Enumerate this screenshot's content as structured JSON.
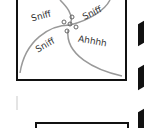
{
  "comic": {
    "panel_top": {
      "words": [
        {
          "text": "Sniff",
          "x": 31,
          "y": 11,
          "rot": -15
        },
        {
          "text": "Sniff",
          "x": 82,
          "y": 8,
          "rot": -25
        },
        {
          "text": "Sniff",
          "x": 35,
          "y": 40,
          "rot": -30
        },
        {
          "text": "Ahhhh",
          "x": 78,
          "y": 36,
          "rot": 10
        }
      ]
    }
  }
}
